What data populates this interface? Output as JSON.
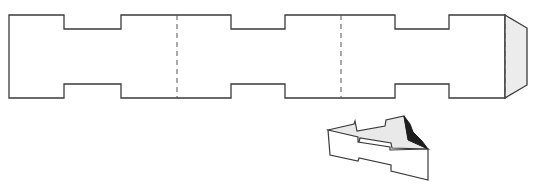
{
  "diagram": {
    "type": "paper-model-template",
    "net": {
      "outline_color": "#3a3a3a",
      "fold_line_style": "dashed",
      "fold_lines_x": [
        177,
        341,
        505
      ],
      "glue_tab_fill": "#ececec",
      "panel_count": 3
    },
    "folded_model": {
      "face_colors": {
        "front": "#ffffff",
        "inner": "#e9e9e9",
        "shadow": "#1e1e1e"
      }
    }
  }
}
